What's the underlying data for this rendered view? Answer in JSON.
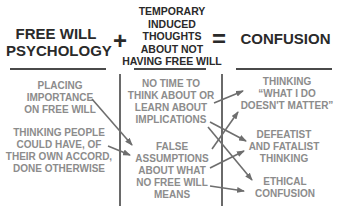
{
  "headers": {
    "col1": [
      "FREE WILL",
      "PSYCHOLOGY"
    ],
    "plus": "+",
    "col2": [
      "TEMPORARY",
      "INDUCED",
      "THOUGHTS",
      "ABOUT NOT",
      "HAVING FREE WILL"
    ],
    "equals": "=",
    "col3": [
      "CONFUSION"
    ]
  },
  "col1_items": [
    {
      "lines": [
        "PLACING",
        "IMPORTANCE",
        "ON FREE WILL"
      ]
    },
    {
      "lines": [
        "THINKING PEOPLE",
        "COULD HAVE, OF",
        "THEIR OWN ACCORD,",
        "DONE OTHERWISE"
      ]
    }
  ],
  "col2_items": [
    {
      "lines": [
        "NO TIME TO",
        "THINK ABOUT OR",
        "LEARN ABOUT",
        "IMPLICATIONS"
      ]
    },
    {
      "lines": [
        "FALSE",
        "ASSUMPTIONS",
        "ABOUT WHAT",
        "NO FREE WILL",
        "MEANS"
      ]
    }
  ],
  "col3_items": [
    {
      "lines": [
        "THINKING",
        "“WHAT I DO",
        "DOESN'T MATTER”"
      ]
    },
    {
      "lines": [
        "DEFEATIST",
        "AND FATALIST",
        "THINKING"
      ]
    },
    {
      "lines": [
        "ETHICAL",
        "CONFUSION"
      ]
    }
  ],
  "arrows": [
    {
      "from": "PLACING IMPORTANCE ON FREE WILL",
      "to": "FALSE ASSUMPTIONS"
    },
    {
      "from": "THINKING PEOPLE COULD HAVE...",
      "to": "FALSE ASSUMPTIONS"
    },
    {
      "from": "NO TIME TO THINK...",
      "to": "THINKING WHAT I DO DOESN'T MATTER"
    },
    {
      "from": "NO TIME TO THINK...",
      "to": "DEFEATIST AND FATALIST THINKING"
    },
    {
      "from": "NO TIME TO THINK...",
      "to": "ETHICAL CONFUSION"
    },
    {
      "from": "FALSE ASSUMPTIONS",
      "to": "THINKING WHAT I DO DOESN'T MATTER"
    },
    {
      "from": "FALSE ASSUMPTIONS",
      "to": "DEFEATIST AND FATALIST THINKING"
    },
    {
      "from": "FALSE ASSUMPTIONS",
      "to": "ETHICAL CONFUSION"
    }
  ],
  "colors": {
    "header": "#2a2a2a",
    "item": "#8c8c8c",
    "arrow": "#6e6e6e",
    "rule": "#4a4a4a"
  }
}
